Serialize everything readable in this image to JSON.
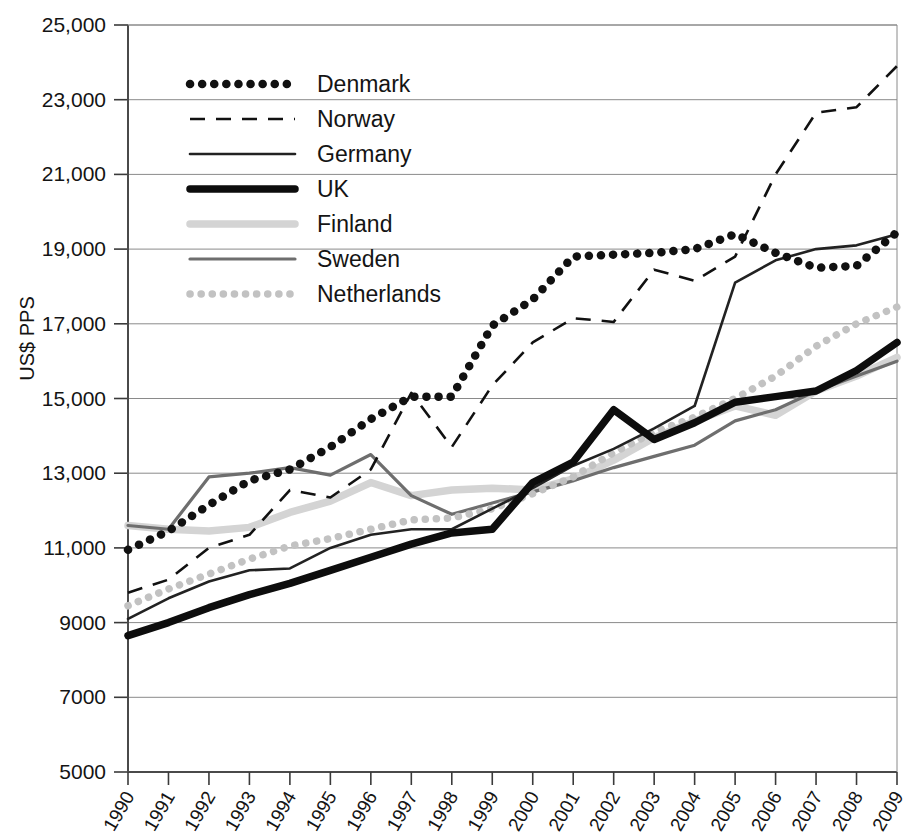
{
  "chart_data": {
    "type": "line",
    "title": "",
    "xlabel": "",
    "ylabel": "US$ PPS",
    "x": [
      1990,
      1991,
      1992,
      1993,
      1994,
      1995,
      1996,
      1997,
      1998,
      1999,
      2000,
      2001,
      2002,
      2003,
      2004,
      2005,
      2006,
      2007,
      2008,
      2009
    ],
    "xtick_labels": [
      "1990",
      "1991",
      "1992",
      "1993",
      "1994",
      "1995",
      "1996",
      "1997",
      "1998",
      "1999",
      "2000",
      "2001",
      "2002",
      "2003",
      "2004",
      "2005",
      "2006",
      "2007",
      "2008",
      "2009"
    ],
    "ytick_labels": [
      "5000",
      "7000",
      "9000",
      "11,000",
      "13,000",
      "15,000",
      "17,000",
      "19,000",
      "21,000",
      "23,000",
      "25,000"
    ],
    "ytick_values": [
      5000,
      7000,
      9000,
      11000,
      13000,
      15000,
      17000,
      19000,
      21000,
      23000,
      25000
    ],
    "ylim": [
      5000,
      25000
    ],
    "xlim": [
      1990,
      2009
    ],
    "grid": true,
    "legend_position": "top-left",
    "series": [
      {
        "name": "Denmark",
        "style": "dotted-thick",
        "color": "#111111",
        "values": [
          10950,
          11450,
          12150,
          12800,
          13100,
          13700,
          14450,
          15050,
          15050,
          16950,
          17650,
          18800,
          18850,
          18900,
          19000,
          19400,
          18900,
          18500,
          18550,
          19450
        ]
      },
      {
        "name": "Norway",
        "style": "dashed",
        "color": "#111111",
        "values": [
          9800,
          10150,
          11000,
          11350,
          12550,
          12350,
          13100,
          15150,
          13700,
          15350,
          16500,
          17150,
          17050,
          18450,
          18150,
          18800,
          21000,
          22650,
          22800,
          23900
        ]
      },
      {
        "name": "Germany",
        "style": "solid-thin",
        "color": "#222222",
        "values": [
          9100,
          9650,
          10100,
          10400,
          10450,
          11000,
          11350,
          11500,
          11500,
          12050,
          12600,
          13200,
          13650,
          14200,
          14800,
          18100,
          18700,
          19000,
          19100,
          19400
        ]
      },
      {
        "name": "UK",
        "style": "solid-thick",
        "color": "#0d0d0d",
        "values": [
          8650,
          9000,
          9400,
          9750,
          10050,
          10400,
          10750,
          11100,
          11400,
          11500,
          12750,
          13300,
          14700,
          13900,
          14350,
          14900,
          15050,
          15200,
          15750,
          16500
        ]
      },
      {
        "name": "Finland",
        "style": "solid-thick-light",
        "color": "#d4d4d4",
        "values": [
          11600,
          11500,
          11450,
          11550,
          11950,
          12250,
          12750,
          12400,
          12550,
          12600,
          12550,
          12850,
          13350,
          13950,
          14400,
          14800,
          14550,
          15200,
          15600,
          16100
        ]
      },
      {
        "name": "Sweden",
        "style": "solid-medium",
        "color": "#6e6e6e",
        "values": [
          11600,
          11500,
          12900,
          13000,
          13150,
          12950,
          13500,
          12400,
          11900,
          12200,
          12500,
          12800,
          13150,
          13450,
          13750,
          14400,
          14700,
          15200,
          15600,
          16000
        ]
      },
      {
        "name": "Netherlands",
        "style": "dotted-light",
        "color": "#c2c2c2",
        "values": [
          9450,
          9900,
          10300,
          10700,
          11050,
          11250,
          11500,
          11750,
          11800,
          12050,
          12450,
          12900,
          13550,
          14100,
          14500,
          15000,
          15600,
          16400,
          17000,
          17450
        ]
      }
    ]
  },
  "legend": {
    "items": [
      {
        "label": "Denmark"
      },
      {
        "label": "Norway"
      },
      {
        "label": "Germany"
      },
      {
        "label": "UK"
      },
      {
        "label": "Finland"
      },
      {
        "label": "Sweden"
      },
      {
        "label": "Netherlands"
      }
    ]
  }
}
